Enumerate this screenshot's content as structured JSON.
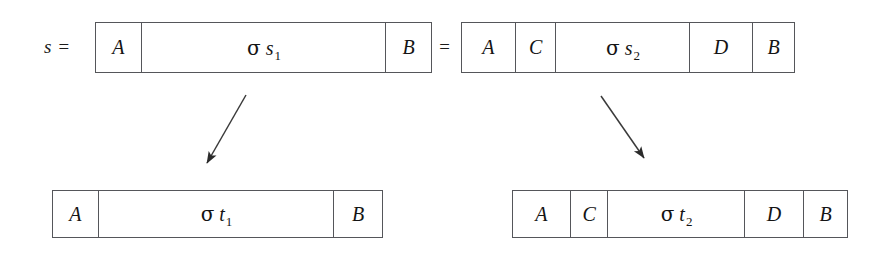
{
  "figure": {
    "background_color": "#ffffff",
    "line_color": "#55565a",
    "text_color": "#141414"
  },
  "labels": {
    "s_equals": "s =",
    "equals": "="
  },
  "boxes": {
    "top_left": {
      "name": "sigma-s1-string",
      "cells": [
        {
          "text": "A",
          "kind": "plain"
        },
        {
          "sigma": "σ",
          "var": "s",
          "sub": "1",
          "kind": "math"
        },
        {
          "text": "B",
          "kind": "plain"
        }
      ]
    },
    "top_right": {
      "name": "sigma-s2-string",
      "cells": [
        {
          "text": "A",
          "kind": "plain"
        },
        {
          "text": "C",
          "kind": "plain"
        },
        {
          "sigma": "σ",
          "var": "s",
          "sub": "2",
          "kind": "math"
        },
        {
          "text": "D",
          "kind": "plain"
        },
        {
          "text": "B",
          "kind": "plain"
        }
      ]
    },
    "bottom_left": {
      "name": "sigma-t1-string",
      "cells": [
        {
          "text": "A",
          "kind": "plain"
        },
        {
          "sigma": "σ",
          "var": "t",
          "sub": "1",
          "kind": "math"
        },
        {
          "text": "B",
          "kind": "plain"
        }
      ]
    },
    "bottom_right": {
      "name": "sigma-t2-string",
      "cells": [
        {
          "text": "A",
          "kind": "plain"
        },
        {
          "text": "C",
          "kind": "plain"
        },
        {
          "sigma": "σ",
          "var": "t",
          "sub": "2",
          "kind": "math"
        },
        {
          "text": "D",
          "kind": "plain"
        },
        {
          "text": "B",
          "kind": "plain"
        }
      ]
    }
  },
  "arrows": [
    {
      "name": "rewrite-arrow-left",
      "direction": "down-left"
    },
    {
      "name": "rewrite-arrow-right",
      "direction": "down-right"
    }
  ]
}
